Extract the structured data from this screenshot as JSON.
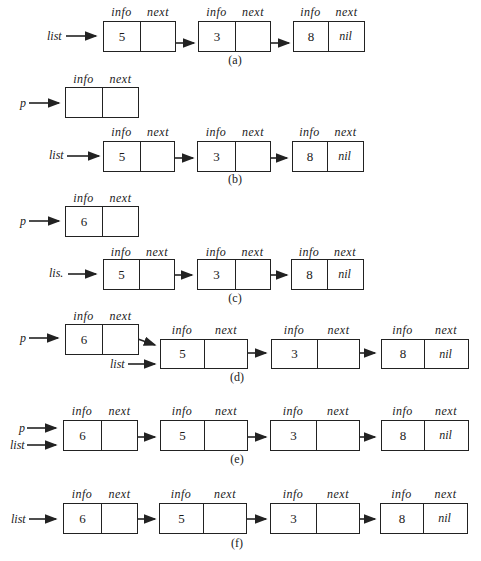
{
  "field_labels": {
    "info": "info",
    "next": "next",
    "nil": "nil"
  },
  "pointer_labels": {
    "list": "list",
    "p": "p",
    "list_c": "lis."
  },
  "captions": {
    "a": "(a)",
    "b": "(b)",
    "c": "(c)",
    "d": "(d)",
    "e": "(e)",
    "f": "(f)"
  },
  "panels": {
    "a": {
      "nodes": [
        {
          "info": "5",
          "next": ""
        },
        {
          "info": "3",
          "next": ""
        },
        {
          "info": "8",
          "next": "nil"
        }
      ]
    },
    "b": {
      "p_node": {
        "info": "",
        "next": ""
      },
      "nodes": [
        {
          "info": "5",
          "next": ""
        },
        {
          "info": "3",
          "next": ""
        },
        {
          "info": "8",
          "next": "nil"
        }
      ]
    },
    "c": {
      "p_node": {
        "info": "6",
        "next": ""
      },
      "nodes": [
        {
          "info": "5",
          "next": ""
        },
        {
          "info": "3",
          "next": ""
        },
        {
          "info": "8",
          "next": "nil"
        }
      ]
    },
    "d": {
      "nodes": [
        {
          "info": "6",
          "next": ""
        },
        {
          "info": "5",
          "next": ""
        },
        {
          "info": "3",
          "next": ""
        },
        {
          "info": "8",
          "next": "nil"
        }
      ]
    },
    "e": {
      "nodes": [
        {
          "info": "6",
          "next": ""
        },
        {
          "info": "5",
          "next": ""
        },
        {
          "info": "3",
          "next": ""
        },
        {
          "info": "8",
          "next": "nil"
        }
      ]
    },
    "f": {
      "nodes": [
        {
          "info": "6",
          "next": ""
        },
        {
          "info": "5",
          "next": ""
        },
        {
          "info": "3",
          "next": ""
        },
        {
          "info": "8",
          "next": "nil"
        }
      ]
    }
  }
}
